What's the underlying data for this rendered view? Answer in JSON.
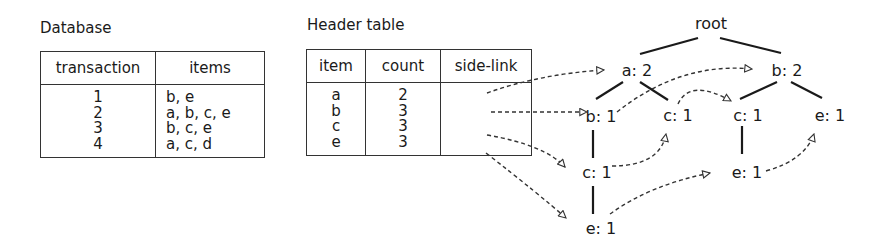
{
  "database": {
    "title": "Database",
    "columns": [
      "transaction",
      "items"
    ],
    "rows": [
      {
        "transaction": "1",
        "items": "b, e"
      },
      {
        "transaction": "2",
        "items": "a, b, c, e"
      },
      {
        "transaction": "3",
        "items": "b, c, e"
      },
      {
        "transaction": "4",
        "items": "a, c, d"
      }
    ]
  },
  "header_table": {
    "title": "Header table",
    "columns": [
      "item",
      "count",
      "side-link"
    ],
    "rows": [
      {
        "item": "a",
        "count": "2",
        "side_link": ""
      },
      {
        "item": "b",
        "count": "3",
        "side_link": ""
      },
      {
        "item": "c",
        "count": "3",
        "side_link": ""
      },
      {
        "item": "e",
        "count": "3",
        "side_link": ""
      }
    ]
  },
  "tree": {
    "nodes": {
      "root": "root",
      "a2": "a: 2",
      "b2": "b: 2",
      "a_b1": "b: 1",
      "a_c1": "c: 1",
      "b_c1": "c: 1",
      "b_e1": "e: 1",
      "a_b_c1": "c: 1",
      "b_c_e1": "e: 1",
      "a_b_c_e1": "e: 1"
    },
    "edges": [
      [
        "root",
        "a2"
      ],
      [
        "root",
        "b2"
      ],
      [
        "a2",
        "a_b1"
      ],
      [
        "a2",
        "a_c1"
      ],
      [
        "b2",
        "b_c1"
      ],
      [
        "b2",
        "b_e1"
      ],
      [
        "a_b1",
        "a_b_c1"
      ],
      [
        "a_b_c1",
        "a_b_c_e1"
      ],
      [
        "b_c1",
        "b_c_e1"
      ]
    ],
    "side_links": [
      [
        "header.a",
        "a2"
      ],
      [
        "header.b",
        "a_b1"
      ],
      [
        "a_b1",
        "b2"
      ],
      [
        "header.c",
        "a_b_c1"
      ],
      [
        "a_b_c1",
        "a_c1"
      ],
      [
        "a_c1",
        "b_c1"
      ],
      [
        "header.e",
        "a_b_c_e1"
      ],
      [
        "a_b_c_e1",
        "b_c_e1"
      ],
      [
        "b_c_e1",
        "b_e1"
      ]
    ]
  },
  "colors": {
    "line": "#1a1a1a",
    "dashed": "#333333"
  }
}
